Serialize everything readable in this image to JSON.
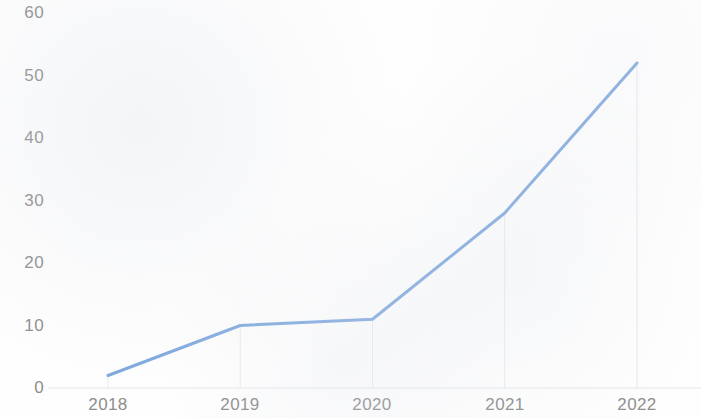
{
  "chart_data": {
    "type": "line",
    "title": "",
    "subtitle": "",
    "xlabel": "",
    "ylabel": "",
    "categories": [
      "2018",
      "2019",
      "2020",
      "2021",
      "2022"
    ],
    "values": [
      2,
      10,
      11,
      28,
      52
    ],
    "series": [
      {
        "name": "",
        "values": [
          2,
          10,
          11,
          28,
          52
        ]
      }
    ],
    "ylim": [
      0,
      60
    ],
    "y_ticks": [
      0,
      10,
      20,
      30,
      40,
      50,
      60
    ],
    "y_tick_labels": [
      "0",
      "10",
      "20",
      "30",
      "40",
      "50",
      "60"
    ],
    "x_tick_labels": [
      "2018",
      "2019",
      "2020",
      "2021",
      "2022"
    ],
    "grid": {
      "horizontal": false,
      "vertical": true,
      "vertical_style": "drop-lines-from-points"
    },
    "legend": {
      "visible": false,
      "position": "none",
      "entries": []
    },
    "annotations": [],
    "markers": false,
    "colors": {
      "line": "#7FA8DE",
      "background": "#FEFEFE",
      "tick_label": "#8D8D8D",
      "gridline": "#E8EAEE",
      "axis": "#E4E6EA"
    },
    "line_width": 3
  },
  "axes": {
    "plot_left": 108,
    "plot_right": 637,
    "baseline_y": 388,
    "top_y": 13
  }
}
